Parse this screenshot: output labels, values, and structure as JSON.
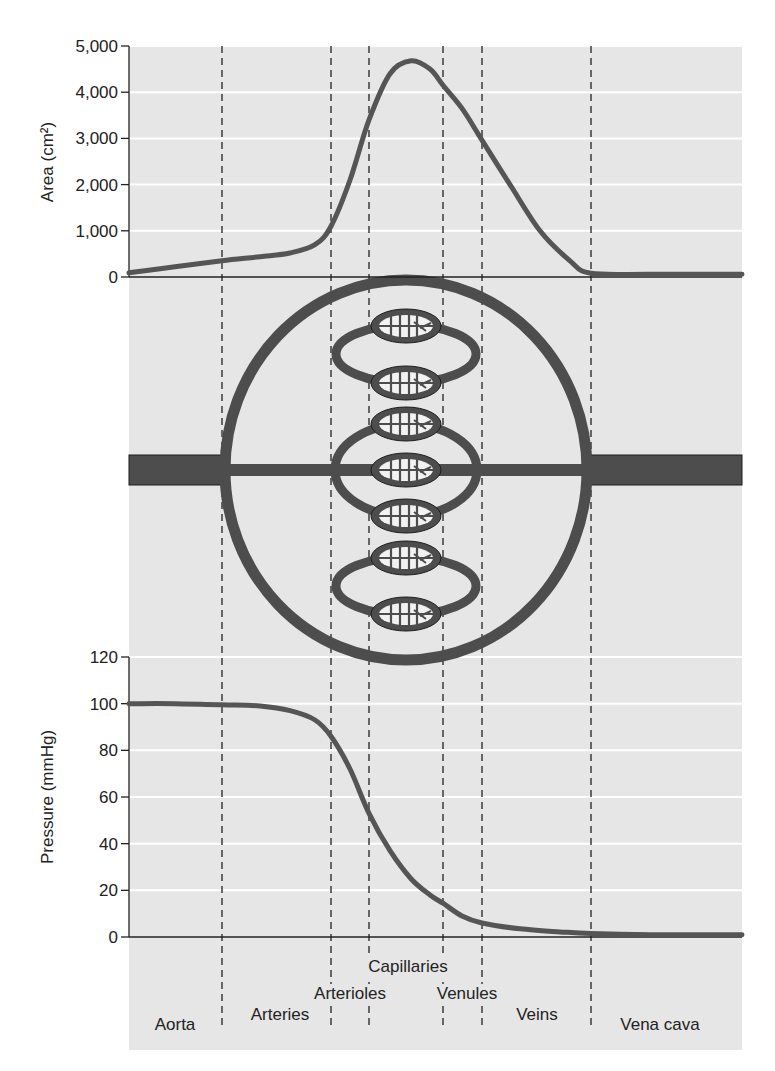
{
  "figure": {
    "background_color": "#e6e6e6",
    "gridline_color": "#ffffff",
    "curve_color": "#555555",
    "vessel_color": "#4d4d4d",
    "dashed_line_color": "#222222"
  },
  "regions": [
    {
      "label": "Aorta",
      "x_start": 129,
      "x_end": 222
    },
    {
      "label": "Arteries",
      "x_start": 222,
      "x_end": 331
    },
    {
      "label": "Arterioles",
      "x_start": 331,
      "x_end": 369
    },
    {
      "label": "Capillaries",
      "x_start": 369,
      "x_end": 443
    },
    {
      "label": "Venules",
      "x_start": 443,
      "x_end": 482
    },
    {
      "label": "Veins",
      "x_start": 482,
      "x_end": 591
    },
    {
      "label": "Vena cava",
      "x_start": 591,
      "x_end": 742
    }
  ],
  "region_labels": [
    {
      "text": "Capillaries",
      "x": 408,
      "y": 972
    },
    {
      "text": "Arterioles",
      "x": 350,
      "y": 999
    },
    {
      "text": "Venules",
      "x": 467,
      "y": 999
    },
    {
      "text": "Arteries",
      "x": 280,
      "y": 1020
    },
    {
      "text": "Veins",
      "x": 537,
      "y": 1020
    },
    {
      "text": "Aorta",
      "x": 175,
      "y": 1030
    },
    {
      "text": "Vena cava",
      "x": 660,
      "y": 1030
    }
  ],
  "chart_data": [
    {
      "type": "line",
      "title": "",
      "xlabel": "",
      "ylabel": "Area (cm²)",
      "ylim": [
        0,
        5000
      ],
      "yticks": [
        0,
        1000,
        2000,
        3000,
        4000,
        5000
      ],
      "ytick_labels": [
        "0",
        "1,000",
        "2,000",
        "3,000",
        "4,000",
        "5,000"
      ],
      "grid": true,
      "categories": [
        "Aorta",
        "Arteries",
        "Arterioles",
        "Capillaries",
        "Venules",
        "Veins",
        "Vena cava"
      ],
      "series": [
        {
          "name": "Cross-sectional area",
          "x": [
            129,
            175,
            222,
            260,
            290,
            315,
            331,
            350,
            369,
            390,
            411,
            430,
            443,
            462,
            482,
            510,
            540,
            570,
            591,
            650,
            742
          ],
          "values": [
            90,
            220,
            350,
            440,
            520,
            700,
            1100,
            2100,
            3400,
            4400,
            4680,
            4500,
            4150,
            3650,
            2960,
            2000,
            1000,
            350,
            80,
            60,
            60
          ]
        }
      ]
    },
    {
      "type": "line",
      "title": "",
      "xlabel": "",
      "ylabel": "Pressure (mmHg)",
      "ylim": [
        0,
        120
      ],
      "yticks": [
        0,
        20,
        40,
        60,
        80,
        100,
        120
      ],
      "ytick_labels": [
        "0",
        "20",
        "40",
        "60",
        "80",
        "100",
        "120"
      ],
      "grid": true,
      "categories": [
        "Aorta",
        "Arteries",
        "Arterioles",
        "Capillaries",
        "Venules",
        "Veins",
        "Vena cava"
      ],
      "series": [
        {
          "name": "Blood pressure",
          "x": [
            129,
            175,
            222,
            260,
            290,
            315,
            331,
            350,
            369,
            390,
            411,
            430,
            443,
            462,
            482,
            520,
            560,
            591,
            650,
            742
          ],
          "values": [
            100,
            100,
            99.5,
            99,
            97,
            93,
            86,
            72,
            53,
            37,
            25,
            18,
            14.5,
            9,
            6,
            3.5,
            2.2,
            1.5,
            1,
            1
          ]
        }
      ]
    }
  ],
  "diagram": {
    "label": "Vessel branching schematic",
    "capillary_bed_centers_y": [
      326,
      383,
      424,
      470,
      516,
      558,
      614
    ]
  }
}
